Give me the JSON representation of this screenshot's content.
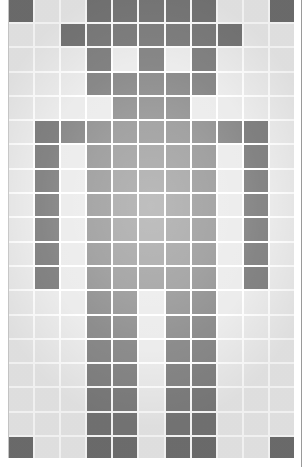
{
  "image": {
    "description": "Pixel-art humanoid figure on a gray tile grid",
    "grid": {
      "columns": 11,
      "rows": 19,
      "filled_color": "#8c8c8c",
      "empty_color": "#ececec",
      "gridline_color": "#ffffff",
      "pattern": [
        "X..XXXXX..X",
        "..XXXXXXX..",
        "...X.X.X...",
        "...XXXXX...",
        "....XXX....",
        ".XXXXXXXXX.",
        ".X.XXXXX.X.",
        ".X.XXXXX.X.",
        ".X.XXXXX.X.",
        ".X.XXXXX.X.",
        ".X.XXXXX.X.",
        ".X.XXXXX.X.",
        "...XX.XX...",
        "...XX.XX...",
        "...XX.XX...",
        "...XX.XX...",
        "...XX.XX...",
        "...XX.XX...",
        "X..XX.XX..X"
      ]
    }
  }
}
